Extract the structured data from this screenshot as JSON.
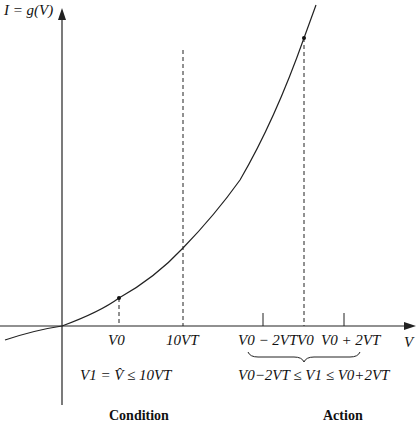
{
  "diagram": {
    "y_axis_label": "I = g(V)",
    "x_axis_label": "V",
    "ticks": {
      "v0_left": "V0",
      "ten_vt": "10VT",
      "v0_minus": "V0 − 2VT",
      "v0_right": "V0",
      "v0_plus": "V0 + 2VT"
    },
    "condition_formula": "V1 = V̂ ≤ 10VT",
    "action_formula": "V0−2VT ≤ V1 ≤ V0+2VT",
    "condition_label": "Condition",
    "action_label": "Action",
    "colors": {
      "line": "#222222",
      "background": "#ffffff"
    }
  }
}
